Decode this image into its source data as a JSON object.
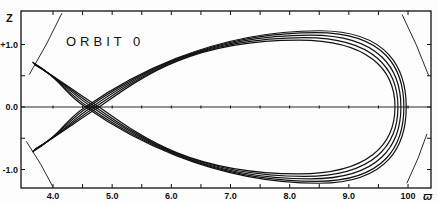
{
  "chart_data": {
    "type": "line",
    "title": "ORBIT 0",
    "xlabel": "ϖ",
    "ylabel": "z",
    "xlim": [
      3.45,
      10.4
    ],
    "ylim": [
      -1.3,
      1.55
    ],
    "grid": false,
    "legend": null,
    "x_tick_labels": [
      "4.0",
      "5.0",
      "6.0",
      "7.0",
      "8.0",
      "9.0",
      "100"
    ],
    "x_ticks": [
      4.0,
      5.0,
      6.0,
      7.0,
      8.0,
      9.0,
      10.0
    ],
    "x_minor_ticks": [
      4.5,
      5.5,
      6.5,
      7.5,
      8.5,
      9.5
    ],
    "y_tick_labels": [
      "+1.0",
      "0.0",
      "-1.0"
    ],
    "y_ticks": [
      1.0,
      0.0,
      -1.0
    ],
    "y_minor_ticks": [
      0.5,
      -0.5
    ],
    "zero_line": {
      "y": 0.0,
      "x_range": [
        3.45,
        10.4
      ]
    },
    "orbit": {
      "description": "Loop (fish-shaped) orbit in the meridional plane, several nearly-overlapping passes",
      "left_cusp": [
        {
          "x": 3.65,
          "y": 0.72
        },
        {
          "x": 3.65,
          "y": -0.72
        }
      ],
      "crossing_x_range": [
        4.55,
        4.8
      ],
      "max_z": 1.2,
      "max_z_at_x": 8.4,
      "right_extreme_x": 9.95,
      "strands": [
        {
          "peak_z": 1.22,
          "peak_x": 8.5,
          "right_x": 9.97,
          "cross_x": 4.55
        },
        {
          "peak_z": 1.19,
          "peak_x": 8.45,
          "right_x": 9.93,
          "cross_x": 4.6
        },
        {
          "peak_z": 1.15,
          "peak_x": 8.35,
          "right_x": 9.88,
          "cross_x": 4.66
        },
        {
          "peak_z": 1.11,
          "peak_x": 8.25,
          "right_x": 9.83,
          "cross_x": 4.72
        },
        {
          "peak_z": 1.07,
          "peak_x": 8.15,
          "right_x": 9.78,
          "cross_x": 4.78
        }
      ]
    },
    "zero_velocity_curves": [
      {
        "points": [
          [
            3.6,
            0.52
          ],
          [
            4.15,
            1.5
          ]
        ]
      },
      {
        "points": [
          [
            3.55,
            -0.55
          ],
          [
            4.0,
            -1.28
          ]
        ]
      },
      {
        "points": [
          [
            9.9,
            1.48
          ],
          [
            10.35,
            0.5
          ]
        ]
      },
      {
        "points": [
          [
            9.98,
            -1.22
          ],
          [
            10.32,
            -0.43
          ]
        ]
      }
    ]
  },
  "labels": {
    "title": "ORBIT 0",
    "x_axis_name": "ϖ",
    "y_axis_name": "z"
  },
  "style": {
    "ink": "#111111",
    "paper": "#fdfdfd"
  }
}
